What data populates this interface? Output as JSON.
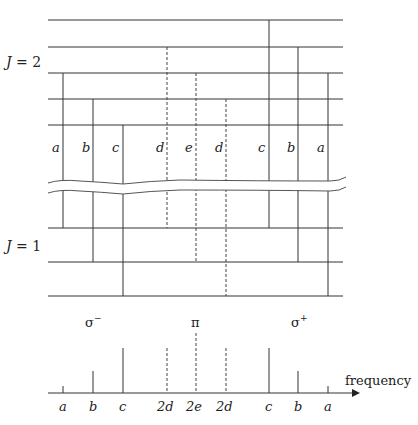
{
  "diagram": {
    "upper_level_label": "J = 2",
    "upper_level_J": "J",
    "upper_level_eq": " = 2",
    "lower_level_label": "J = 1",
    "lower_level_J": "J",
    "lower_level_eq": " = 1",
    "transition_labels": [
      "a",
      "b",
      "c",
      "d",
      "e",
      "d",
      "c",
      "b",
      "a"
    ],
    "polarization_labels": {
      "sigma_minus": "σ",
      "sigma_minus_sup": "−",
      "pi": "π",
      "sigma_plus": "σ",
      "sigma_plus_sup": "+"
    },
    "spectrum_tick_labels": [
      "a",
      "b",
      "c",
      "2d",
      "2e",
      "2d",
      "c",
      "b",
      "a"
    ],
    "axis_label": "frequency",
    "colors": {
      "line": "#333333",
      "text": "#222222",
      "background": "#ffffff"
    }
  }
}
